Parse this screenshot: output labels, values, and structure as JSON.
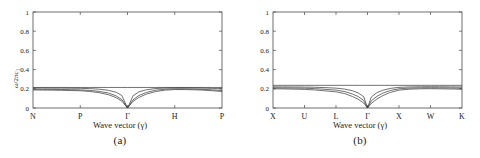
{
  "figure": {
    "panels": [
      {
        "id": "a",
        "caption": "(a)",
        "xlabel": "Wave vector (γ)",
        "ylabel_main": "ω/2πc",
        "ylabel_sub": "1",
        "yticks": [
          "0",
          "0.2",
          "0.4",
          "0.6",
          "0.8",
          "1"
        ],
        "ytick_values": [
          0,
          0.2,
          0.4,
          0.6,
          0.8,
          1
        ],
        "xticks": [
          "N",
          "P",
          "Γ",
          "H",
          "P"
        ],
        "xtick_positions": [
          0,
          0.25,
          0.5,
          0.75,
          1
        ]
      },
      {
        "id": "b",
        "caption": "(b)",
        "xlabel": "Wave vector (γ)",
        "ylabel_main": "ω/2πc",
        "ylabel_sub": "1",
        "yticks": [
          "0",
          "0.2",
          "0.4",
          "0.6",
          "0.8",
          "1"
        ],
        "ytick_values": [
          0,
          0.2,
          0.4,
          0.6,
          0.8,
          1
        ],
        "xticks": [
          "X",
          "U",
          "L",
          "Γ",
          "X",
          "W",
          "K"
        ],
        "xtick_positions": [
          0,
          0.1667,
          0.3333,
          0.5,
          0.6667,
          0.8333,
          1
        ]
      }
    ]
  },
  "chart_data": [
    {
      "type": "line",
      "title": "(a)",
      "xlabel": "Wave vector (γ)",
      "ylabel": "ω/2πc₁",
      "ylim": [
        0,
        1
      ],
      "xlim": [
        0,
        1
      ],
      "grid": false,
      "legend": "none",
      "categories": [
        "N",
        "P",
        "Γ",
        "H",
        "P"
      ],
      "category_x": [
        0,
        0.25,
        0.5,
        0.75,
        1
      ],
      "x": [
        0,
        0.05,
        0.1,
        0.15,
        0.2,
        0.25,
        0.3,
        0.35,
        0.4,
        0.44,
        0.47,
        0.5,
        0.53,
        0.56,
        0.6,
        0.65,
        0.7,
        0.75,
        0.8,
        0.85,
        0.9,
        0.95,
        1
      ],
      "series": [
        {
          "name": "band-1",
          "values": [
            0.188,
            0.187,
            0.186,
            0.184,
            0.182,
            0.18,
            0.172,
            0.16,
            0.138,
            0.108,
            0.072,
            0.0,
            0.07,
            0.11,
            0.145,
            0.172,
            0.186,
            0.192,
            0.192,
            0.19,
            0.186,
            0.18,
            0.172
          ]
        },
        {
          "name": "band-2",
          "values": [
            0.196,
            0.195,
            0.194,
            0.193,
            0.191,
            0.189,
            0.183,
            0.173,
            0.155,
            0.126,
            0.088,
            0.0,
            0.086,
            0.13,
            0.162,
            0.186,
            0.196,
            0.2,
            0.2,
            0.198,
            0.194,
            0.189,
            0.182
          ]
        },
        {
          "name": "band-3",
          "values": [
            0.208,
            0.208,
            0.207,
            0.207,
            0.206,
            0.205,
            0.202,
            0.196,
            0.184,
            0.164,
            0.13,
            0.0,
            0.128,
            0.168,
            0.19,
            0.203,
            0.208,
            0.21,
            0.21,
            0.209,
            0.207,
            0.204,
            0.2
          ]
        },
        {
          "name": "band-4",
          "values": [
            0.214,
            0.214,
            0.214,
            0.214,
            0.214,
            0.214,
            0.214,
            0.214,
            0.214,
            0.214,
            0.214,
            0.214,
            0.214,
            0.214,
            0.214,
            0.214,
            0.214,
            0.214,
            0.214,
            0.214,
            0.214,
            0.214,
            0.214
          ]
        }
      ]
    },
    {
      "type": "line",
      "title": "(b)",
      "xlabel": "Wave vector (γ)",
      "ylabel": "ω/2πc₁",
      "ylim": [
        0,
        1
      ],
      "xlim": [
        0,
        1
      ],
      "grid": false,
      "legend": "none",
      "categories": [
        "X",
        "U",
        "L",
        "Γ",
        "X",
        "W",
        "K"
      ],
      "category_x": [
        0,
        0.1667,
        0.3333,
        0.5,
        0.6667,
        0.8333,
        1
      ],
      "x": [
        0,
        0.05,
        0.1,
        0.1667,
        0.22,
        0.28,
        0.3333,
        0.38,
        0.42,
        0.45,
        0.48,
        0.5,
        0.52,
        0.55,
        0.58,
        0.62,
        0.6667,
        0.72,
        0.78,
        0.8333,
        0.88,
        0.94,
        1
      ],
      "series": [
        {
          "name": "band-1",
          "values": [
            0.2,
            0.199,
            0.197,
            0.194,
            0.188,
            0.178,
            0.168,
            0.15,
            0.12,
            0.092,
            0.052,
            0.0,
            0.048,
            0.094,
            0.128,
            0.162,
            0.186,
            0.196,
            0.2,
            0.201,
            0.2,
            0.198,
            0.196
          ]
        },
        {
          "name": "band-2",
          "values": [
            0.21,
            0.209,
            0.208,
            0.206,
            0.202,
            0.194,
            0.186,
            0.171,
            0.146,
            0.12,
            0.078,
            0.0,
            0.074,
            0.122,
            0.154,
            0.182,
            0.2,
            0.207,
            0.21,
            0.211,
            0.21,
            0.209,
            0.207
          ]
        },
        {
          "name": "band-3",
          "values": [
            0.22,
            0.22,
            0.219,
            0.218,
            0.216,
            0.212,
            0.207,
            0.197,
            0.18,
            0.158,
            0.118,
            0.0,
            0.114,
            0.16,
            0.184,
            0.204,
            0.215,
            0.219,
            0.221,
            0.222,
            0.221,
            0.22,
            0.219
          ]
        },
        {
          "name": "band-4",
          "values": [
            0.236,
            0.236,
            0.236,
            0.236,
            0.236,
            0.236,
            0.236,
            0.236,
            0.236,
            0.236,
            0.236,
            0.236,
            0.236,
            0.236,
            0.236,
            0.236,
            0.236,
            0.236,
            0.236,
            0.236,
            0.236,
            0.236,
            0.236
          ]
        }
      ]
    }
  ]
}
